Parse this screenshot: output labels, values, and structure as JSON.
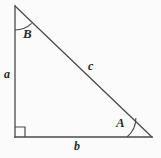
{
  "diagram": {
    "name": "right-triangle-labeled",
    "background_color": "#fbfbfb",
    "stroke_color": "#4a4a4a",
    "text_color": "#2a2a2a",
    "vertices": {
      "top": {
        "x": 15,
        "y": 6
      },
      "bottom_left": {
        "x": 15,
        "y": 137
      },
      "bottom_right": {
        "x": 152,
        "y": 137
      }
    },
    "sides": [
      {
        "id": "a",
        "label": "a",
        "from": "top",
        "to": "bottom_left",
        "role": "vertical-leg"
      },
      {
        "id": "b",
        "label": "b",
        "from": "bottom_left",
        "to": "bottom_right",
        "role": "horizontal-leg"
      },
      {
        "id": "c",
        "label": "c",
        "from": "top",
        "to": "bottom_right",
        "role": "hypotenuse"
      }
    ],
    "angles": [
      {
        "id": "B",
        "label": "B",
        "at": "top",
        "marker": "arc"
      },
      {
        "id": "A",
        "label": "A",
        "at": "bottom_right",
        "marker": "arc"
      },
      {
        "id": "C",
        "label": "",
        "at": "bottom_left",
        "marker": "right-angle-square"
      }
    ]
  }
}
